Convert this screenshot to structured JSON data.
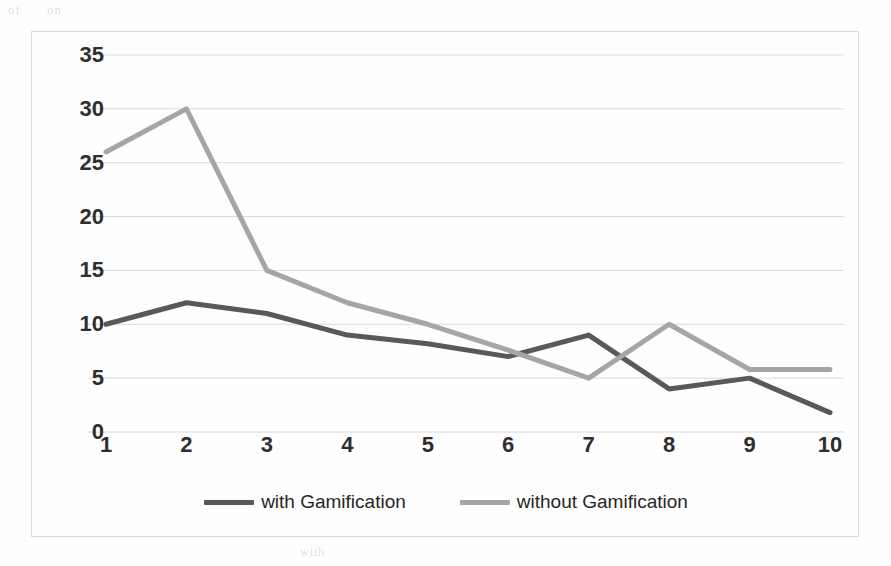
{
  "scan_artifacts": {
    "top_ghost_text": "of on",
    "bottom_ghost_text": "with",
    "right_ghost_text": ""
  },
  "chart_data": {
    "type": "line",
    "title": "",
    "subtitle": "",
    "xlabel": "",
    "ylabel": "",
    "categories": [
      "1",
      "2",
      "3",
      "4",
      "5",
      "6",
      "7",
      "8",
      "9",
      "10"
    ],
    "x_tick_labels": [
      "1",
      "2",
      "3",
      "4",
      "5",
      "6",
      "7",
      "8",
      "9",
      "10"
    ],
    "y_tick_labels": [
      "0",
      "5",
      "10",
      "15",
      "20",
      "25",
      "30",
      "35"
    ],
    "y_ticks": [
      0,
      5,
      10,
      15,
      20,
      25,
      30,
      35
    ],
    "ylim": [
      0,
      35
    ],
    "grid": "horizontal",
    "legend_position": "bottom",
    "series": [
      {
        "name": "with Gamification",
        "color": "#595959",
        "values": [
          10,
          12,
          11,
          9,
          8.2,
          7,
          9,
          4,
          5,
          1.8
        ]
      },
      {
        "name": "without Gamification",
        "color": "#a6a6a6",
        "values": [
          26,
          30,
          15,
          12,
          10,
          7.6,
          5,
          10,
          5.8,
          5.8
        ]
      }
    ],
    "colors": {
      "grid": "#d9dbdd",
      "border": "#d9dbdd",
      "axis_text": "#2e2e2e",
      "plot_background": "#ffffff"
    }
  },
  "legend": {
    "items": [
      {
        "label": "with Gamification",
        "color": "#595959"
      },
      {
        "label": "without Gamification",
        "color": "#a6a6a6"
      }
    ]
  }
}
